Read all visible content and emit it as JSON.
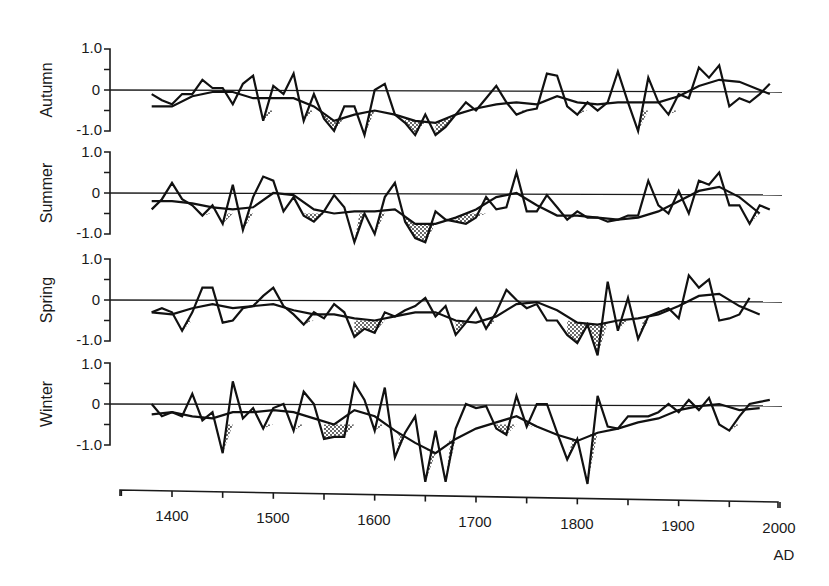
{
  "chart_data": [
    {
      "type": "line",
      "title": "Autumn",
      "ylabel": "Autumn",
      "xlabel": "AD",
      "ylim": [
        -1.0,
        1.0
      ],
      "yticks": [
        "1.0",
        "0",
        "-1.0"
      ],
      "xlim": [
        1350,
        2000
      ],
      "series": [
        {
          "name": "decadal index",
          "x": [
            1380,
            1390,
            1400,
            1410,
            1420,
            1430,
            1440,
            1450,
            1460,
            1470,
            1480,
            1490,
            1500,
            1510,
            1520,
            1530,
            1540,
            1550,
            1560,
            1570,
            1580,
            1590,
            1600,
            1610,
            1620,
            1630,
            1640,
            1650,
            1660,
            1670,
            1680,
            1690,
            1700,
            1710,
            1720,
            1730,
            1740,
            1750,
            1760,
            1770,
            1780,
            1790,
            1800,
            1810,
            1820,
            1830,
            1840,
            1850,
            1860,
            1870,
            1880,
            1890,
            1900,
            1910,
            1920,
            1930,
            1940,
            1950,
            1960,
            1970,
            1980,
            1990
          ],
          "values": [
            -0.1,
            -0.25,
            -0.35,
            -0.1,
            -0.1,
            0.25,
            0.05,
            0.05,
            -0.35,
            0.15,
            0.35,
            -0.75,
            0.1,
            -0.1,
            0.4,
            -0.75,
            -0.1,
            -0.7,
            -1.0,
            -0.4,
            -0.4,
            -1.1,
            0.0,
            0.15,
            -0.6,
            -0.8,
            -1.1,
            -0.6,
            -1.1,
            -0.9,
            -0.6,
            -0.3,
            -0.5,
            -0.2,
            0.1,
            -0.3,
            -0.6,
            -0.5,
            -0.45,
            0.4,
            0.35,
            -0.4,
            -0.6,
            -0.3,
            -0.5,
            -0.3,
            0.45,
            -0.3,
            -1.0,
            0.3,
            -0.3,
            -0.6,
            -0.1,
            -0.2,
            0.55,
            0.3,
            0.6,
            -0.4,
            -0.2,
            -0.3,
            -0.1,
            0.15
          ]
        },
        {
          "name": "smoothed",
          "x": [
            1380,
            1400,
            1420,
            1440,
            1460,
            1480,
            1500,
            1520,
            1540,
            1560,
            1580,
            1600,
            1620,
            1640,
            1660,
            1680,
            1700,
            1720,
            1740,
            1760,
            1780,
            1800,
            1820,
            1840,
            1860,
            1880,
            1900,
            1920,
            1940,
            1960,
            1980,
            1990
          ],
          "values": [
            -0.4,
            -0.4,
            -0.15,
            -0.05,
            -0.05,
            -0.2,
            -0.2,
            -0.2,
            -0.4,
            -0.75,
            -0.6,
            -0.5,
            -0.6,
            -0.75,
            -0.8,
            -0.6,
            -0.45,
            -0.35,
            -0.3,
            -0.35,
            -0.15,
            -0.3,
            -0.35,
            -0.3,
            -0.3,
            -0.3,
            -0.15,
            0.1,
            0.25,
            0.2,
            0.0,
            -0.1
          ]
        }
      ]
    },
    {
      "type": "line",
      "title": "Summer",
      "ylabel": "Summer",
      "ylim": [
        -1.0,
        1.0
      ],
      "yticks": [
        "1.0",
        "0",
        "-1.0"
      ],
      "series": [
        {
          "name": "decadal index",
          "x": [
            1380,
            1390,
            1400,
            1410,
            1420,
            1430,
            1440,
            1450,
            1460,
            1470,
            1480,
            1490,
            1500,
            1510,
            1520,
            1530,
            1540,
            1550,
            1560,
            1570,
            1580,
            1590,
            1600,
            1610,
            1620,
            1630,
            1640,
            1650,
            1660,
            1670,
            1680,
            1690,
            1700,
            1710,
            1720,
            1730,
            1740,
            1750,
            1760,
            1770,
            1780,
            1790,
            1800,
            1810,
            1820,
            1830,
            1840,
            1850,
            1860,
            1870,
            1880,
            1890,
            1900,
            1910,
            1920,
            1930,
            1940,
            1950,
            1960,
            1970,
            1980,
            1990
          ],
          "values": [
            -0.4,
            -0.15,
            0.25,
            -0.15,
            -0.3,
            -0.55,
            -0.3,
            -0.75,
            0.2,
            -0.9,
            -0.1,
            0.4,
            0.3,
            -0.45,
            -0.1,
            -0.55,
            -0.7,
            -0.45,
            -0.05,
            -0.35,
            -1.2,
            -0.5,
            -1.0,
            -0.1,
            0.25,
            -0.7,
            -1.1,
            -1.2,
            -0.45,
            -0.65,
            -0.7,
            -0.75,
            -0.6,
            -0.1,
            -0.4,
            -0.35,
            0.5,
            -0.45,
            -0.45,
            -0.05,
            -0.35,
            -0.65,
            -0.45,
            -0.6,
            -0.6,
            -0.7,
            -0.65,
            -0.55,
            -0.55,
            0.3,
            -0.3,
            -0.5,
            0.05,
            -0.5,
            0.3,
            0.2,
            0.5,
            -0.3,
            -0.3,
            -0.75,
            -0.3,
            -0.4
          ]
        },
        {
          "name": "smoothed",
          "x": [
            1380,
            1400,
            1420,
            1440,
            1460,
            1480,
            1500,
            1520,
            1540,
            1560,
            1580,
            1600,
            1620,
            1640,
            1660,
            1680,
            1700,
            1720,
            1740,
            1760,
            1780,
            1800,
            1820,
            1840,
            1860,
            1880,
            1900,
            1920,
            1940,
            1960,
            1980
          ],
          "values": [
            -0.2,
            -0.2,
            -0.25,
            -0.35,
            -0.4,
            -0.35,
            0.0,
            -0.05,
            -0.4,
            -0.5,
            -0.45,
            -0.45,
            -0.4,
            -0.75,
            -0.75,
            -0.6,
            -0.4,
            -0.1,
            0.0,
            -0.3,
            -0.55,
            -0.55,
            -0.6,
            -0.65,
            -0.6,
            -0.45,
            -0.2,
            0.05,
            0.15,
            -0.1,
            -0.5
          ]
        }
      ]
    },
    {
      "type": "line",
      "title": "Spring",
      "ylabel": "Spring",
      "ylim": [
        -1.0,
        1.0
      ],
      "yticks": [
        "1.0",
        "0",
        "-1.0"
      ],
      "series": [
        {
          "name": "decadal index",
          "x": [
            1380,
            1390,
            1400,
            1410,
            1420,
            1430,
            1440,
            1450,
            1460,
            1470,
            1480,
            1490,
            1500,
            1510,
            1520,
            1530,
            1540,
            1550,
            1560,
            1570,
            1580,
            1590,
            1600,
            1610,
            1620,
            1630,
            1640,
            1650,
            1660,
            1670,
            1680,
            1690,
            1700,
            1710,
            1720,
            1730,
            1740,
            1750,
            1760,
            1770,
            1780,
            1790,
            1800,
            1810,
            1820,
            1830,
            1840,
            1850,
            1860,
            1870,
            1880,
            1890,
            1900,
            1910,
            1920,
            1930,
            1940,
            1950,
            1960,
            1970,
            1980,
            1990
          ],
          "values": [
            -0.3,
            -0.2,
            -0.3,
            -0.75,
            -0.3,
            0.3,
            0.3,
            -0.55,
            -0.5,
            -0.2,
            -0.15,
            0.1,
            0.3,
            -0.15,
            -0.35,
            -0.6,
            -0.3,
            -0.45,
            -0.1,
            -0.3,
            -0.9,
            -0.7,
            -0.8,
            -0.3,
            -0.4,
            -0.25,
            -0.15,
            0.05,
            -0.4,
            -0.15,
            -0.85,
            -0.55,
            -0.2,
            -0.7,
            -0.3,
            0.25,
            0.0,
            -0.2,
            -0.1,
            -0.5,
            -0.5,
            -0.85,
            -1.05,
            -0.6,
            -1.35,
            0.45,
            -0.75,
            0.05,
            -0.95,
            -0.4,
            -0.3,
            -0.2,
            -0.45,
            0.6,
            0.3,
            0.5,
            -0.5,
            -0.45,
            -0.35,
            0.05
          ]
        },
        {
          "name": "smoothed",
          "x": [
            1380,
            1400,
            1420,
            1440,
            1460,
            1480,
            1500,
            1520,
            1540,
            1560,
            1580,
            1600,
            1620,
            1640,
            1660,
            1680,
            1700,
            1720,
            1740,
            1760,
            1780,
            1800,
            1820,
            1840,
            1860,
            1880,
            1900,
            1920,
            1940,
            1960,
            1980
          ],
          "values": [
            -0.3,
            -0.35,
            -0.2,
            -0.1,
            -0.2,
            -0.15,
            -0.1,
            -0.25,
            -0.35,
            -0.35,
            -0.45,
            -0.5,
            -0.4,
            -0.3,
            -0.3,
            -0.5,
            -0.55,
            -0.4,
            -0.1,
            -0.05,
            -0.25,
            -0.55,
            -0.6,
            -0.5,
            -0.45,
            -0.35,
            -0.15,
            0.1,
            0.15,
            -0.15,
            -0.35
          ]
        }
      ]
    },
    {
      "type": "line",
      "title": "Winter",
      "ylabel": "Winter",
      "ylim": [
        -1.0,
        1.0
      ],
      "yticks": [
        "1.0",
        "0",
        "-1.0"
      ],
      "series": [
        {
          "name": "decadal index",
          "x": [
            1380,
            1390,
            1400,
            1410,
            1420,
            1430,
            1440,
            1450,
            1460,
            1470,
            1480,
            1490,
            1500,
            1510,
            1520,
            1530,
            1540,
            1550,
            1560,
            1570,
            1580,
            1590,
            1600,
            1610,
            1620,
            1630,
            1640,
            1650,
            1660,
            1670,
            1680,
            1690,
            1700,
            1710,
            1720,
            1730,
            1740,
            1750,
            1760,
            1770,
            1780,
            1790,
            1800,
            1810,
            1820,
            1830,
            1840,
            1850,
            1860,
            1870,
            1880,
            1890,
            1900,
            1910,
            1920,
            1930,
            1940,
            1950,
            1960,
            1970,
            1980,
            1990
          ],
          "values": [
            0.0,
            -0.3,
            -0.2,
            -0.3,
            0.25,
            -0.4,
            -0.2,
            -1.2,
            0.55,
            -0.35,
            -0.1,
            -0.6,
            -0.1,
            0.0,
            -0.65,
            0.3,
            0.0,
            -0.85,
            -0.8,
            -0.8,
            0.5,
            0.1,
            -0.65,
            0.4,
            -1.3,
            -0.7,
            -0.3,
            -1.9,
            -0.65,
            -1.9,
            -0.6,
            0.0,
            -0.1,
            -0.05,
            -0.6,
            -0.75,
            0.2,
            -0.55,
            0.0,
            0.0,
            -0.7,
            -1.35,
            -0.85,
            -1.95,
            0.2,
            -0.55,
            -0.6,
            -0.3,
            -0.3,
            -0.3,
            -0.2,
            0.0,
            -0.2,
            0.1,
            -0.15,
            0.15,
            -0.5,
            -0.65,
            -0.3,
            0.0,
            0.05,
            0.1
          ]
        },
        {
          "name": "smoothed",
          "x": [
            1380,
            1400,
            1420,
            1440,
            1460,
            1480,
            1500,
            1520,
            1540,
            1560,
            1580,
            1600,
            1620,
            1640,
            1660,
            1680,
            1700,
            1720,
            1740,
            1760,
            1780,
            1800,
            1820,
            1840,
            1860,
            1880,
            1900,
            1920,
            1940,
            1960,
            1980
          ],
          "values": [
            -0.25,
            -0.2,
            -0.3,
            -0.35,
            -0.2,
            -0.2,
            -0.15,
            -0.2,
            -0.35,
            -0.5,
            -0.15,
            -0.3,
            -0.65,
            -0.95,
            -1.2,
            -0.85,
            -0.6,
            -0.45,
            -0.3,
            -0.55,
            -0.75,
            -0.9,
            -0.7,
            -0.6,
            -0.45,
            -0.35,
            -0.15,
            -0.05,
            0.0,
            -0.15,
            -0.1
          ]
        }
      ]
    }
  ],
  "axis": {
    "x_ticks": [
      "1400",
      "1500",
      "1600",
      "1700",
      "1800",
      "1900",
      "2000"
    ],
    "x_unit": "AD"
  },
  "panels": [
    {
      "label": "Autumn",
      "y_top": "1.0",
      "y_mid": "0",
      "y_bot": "-1.0"
    },
    {
      "label": "Summer",
      "y_top": "1.0",
      "y_mid": "0",
      "y_bot": "-1.0"
    },
    {
      "label": "Spring",
      "y_top": "1.0",
      "y_mid": "0",
      "y_bot": "-1.0"
    },
    {
      "label": "Winter",
      "y_top": "1.0",
      "y_mid": "0",
      "y_bot": "-1.0"
    }
  ]
}
